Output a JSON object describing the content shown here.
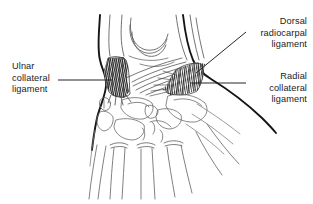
{
  "figure": {
    "background_color": "#ffffff",
    "ink_color": "#1a1a1a",
    "line_color": "#4a4a4a",
    "bone_outline_color": "#5a5a5a",
    "hatch_color": "#2b2b2b"
  },
  "labels": {
    "ulnar_collateral": "Ulnar\ncollateral\nligament",
    "dorsal_radiocarpal": "Dorsal\nradiocarpal\nligament",
    "radial_collateral": "Radial\ncollateral\nligament"
  },
  "leader_lines": [
    {
      "name": "leader-ulnar",
      "from": [
        58,
        80
      ],
      "to": [
        112,
        80
      ],
      "orientation": "horizontal"
    },
    {
      "name": "leader-dorsal-radiocarpal",
      "from": [
        246,
        32
      ],
      "to": [
        196,
        73
      ],
      "orientation": "diagonal"
    },
    {
      "name": "leader-radial-collateral",
      "from": [
        246,
        83
      ],
      "to": [
        190,
        83
      ],
      "orientation": "horizontal"
    }
  ],
  "anatomy": {
    "structures": [
      "ulna-shaft",
      "radius-shaft",
      "distal-radius-articular-surface",
      "ulnar-collateral-ligament-hatch",
      "radial-collateral-ligament-hatch",
      "dorsal-radiocarpal-ligament-fibers",
      "carpal-bones",
      "metacarpal-bases",
      "metacarpal-shafts",
      "skin-contour-ulnar-side",
      "skin-contour-radial-side"
    ]
  }
}
